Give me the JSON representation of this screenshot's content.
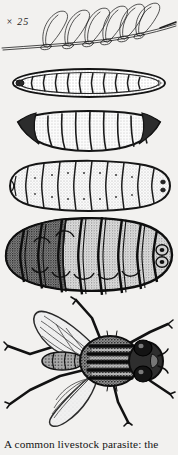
{
  "plate": {
    "magnification_label": "× 25",
    "caption": "A common livestock parasite: the",
    "background_color": "#f2f1ef",
    "ink_color": "#1b1b1b",
    "figures": [
      {
        "id": "eggs",
        "name": "eggs-on-hair",
        "label": "eggs attached to a hair shaft",
        "egg_count": 6,
        "magnification": "× 25"
      },
      {
        "id": "larva1",
        "name": "first-instar-larva",
        "label": "first instar larva",
        "segment_count": 11,
        "shape": "elongated oval, pale, outlined"
      },
      {
        "id": "larva2",
        "name": "second-instar-larva",
        "label": "second instar larva",
        "segment_count": 11,
        "shape": "crescent curved, segmented"
      },
      {
        "id": "larva3",
        "name": "third-instar-larva",
        "label": "third instar larva",
        "segment_count": 11,
        "shape": "plump elongated grub"
      },
      {
        "id": "larva4",
        "name": "mature-larva-warble",
        "label": "mature larva (warble)",
        "segment_count": 11,
        "shape": "broad dark spiny grub"
      },
      {
        "id": "fly",
        "name": "adult-fly",
        "label": "adult fly, dorsal view",
        "wing_count": 2,
        "leg_count": 6,
        "shape": "dorsal view with spread wings and striped thorax"
      }
    ]
  }
}
